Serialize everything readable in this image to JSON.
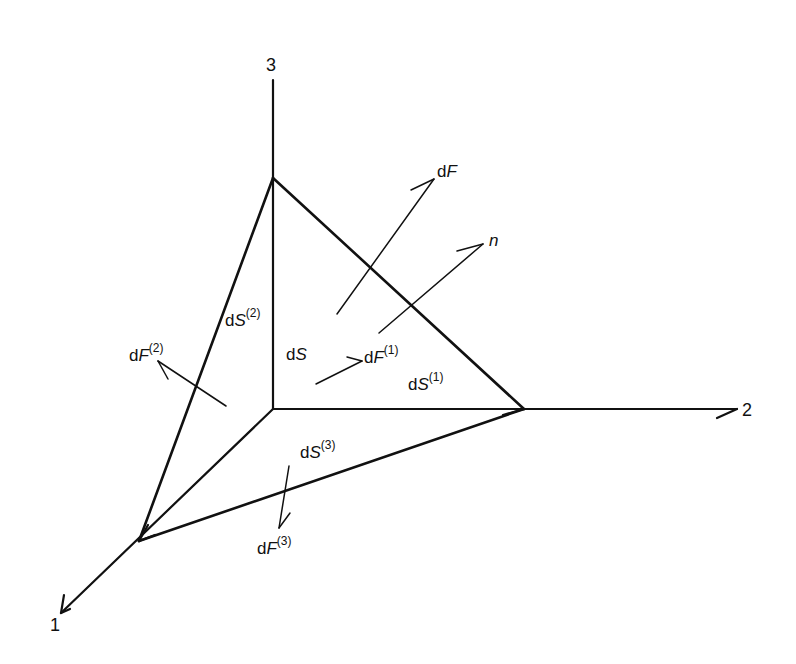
{
  "diagram": {
    "type": "cauchy-tetrahedron",
    "axes": [
      {
        "id": "1",
        "label": "1"
      },
      {
        "id": "2",
        "label": "2"
      },
      {
        "id": "3",
        "label": "3"
      }
    ],
    "labels": {
      "dF": {
        "prefix": "d",
        "var": "F",
        "sup": ""
      },
      "n": {
        "var": "n"
      },
      "dS": {
        "prefix": "d",
        "var": "S",
        "sup": ""
      },
      "dS1": {
        "prefix": "d",
        "var": "S",
        "sup": "(1)"
      },
      "dS2": {
        "prefix": "d",
        "var": "S",
        "sup": "(2)"
      },
      "dS3": {
        "prefix": "d",
        "var": "S",
        "sup": "(3)"
      },
      "dF1": {
        "prefix": "d",
        "var": "F",
        "sup": "(1)"
      },
      "dF2": {
        "prefix": "d",
        "var": "F",
        "sup": "(2)"
      },
      "dF3": {
        "prefix": "d",
        "var": "F",
        "sup": "(3)"
      }
    },
    "colors": {
      "stroke": "#111111",
      "background": "#ffffff"
    }
  }
}
